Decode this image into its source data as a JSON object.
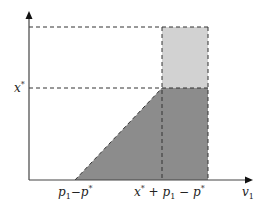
{
  "diagram": {
    "axes": {
      "x_label": "v",
      "x_label_sub": "1",
      "y_tick_label": "x",
      "y_tick_sup": "*"
    },
    "x_ticks": [
      {
        "id": "p1-minus-pstar",
        "parts": [
          "p",
          "1",
          "−p",
          "*"
        ]
      },
      {
        "id": "xstar-plus-p1-minus-pstar",
        "parts": [
          "x",
          "*",
          " + p",
          "1",
          " − p",
          "*"
        ]
      }
    ],
    "regions": {
      "dark_fill": "#8c8c8c",
      "light_fill": "#d2d2d2"
    },
    "colors": {
      "axis": "#444444",
      "dash": "#333333"
    }
  }
}
